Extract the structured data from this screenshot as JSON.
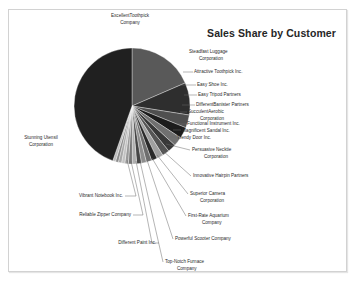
{
  "chart_title": "Sales Share by Customer",
  "chart_data": {
    "type": "pie",
    "title": "Sales Share by Customer",
    "xlabel": "",
    "ylabel": "",
    "legend_position": "none",
    "grid": false,
    "labels_placement": "outside-with-leader-lines",
    "categories": [
      "Excellent Toothpick Company",
      "Steadfast Luggage Corporation",
      "Attractive Toothpick Inc.",
      "Easy Shoe Inc.",
      "Easy Tripod Partners",
      "Different Banister Partners",
      "Succulent Aerobic Corporation",
      "Functional Instrument Inc.",
      "Magnificent Sandal Inc.",
      "Trendy Door Inc.",
      "Persuasive Necktie Corporation",
      "Innovative Hairpin Partners",
      "Superior Camera Corporation",
      "First-Rate Aquarium Company",
      "Powerful Scooter Company",
      "Top-Notch Furnace Company",
      "Different Paint Inc.",
      "Reliable Zipper Company",
      "Vibrant Notebook Inc.",
      "Stunning Utensil Corporation"
    ],
    "values": [
      18.5,
      9.0,
      3.6,
      3.1,
      2.6,
      2.3,
      2.0,
      1.8,
      1.6,
      1.5,
      1.4,
      1.3,
      1.2,
      1.1,
      1.0,
      0.9,
      0.9,
      0.8,
      0.8,
      44.6
    ],
    "units": "percent of sales share",
    "colors": [
      "#595959",
      "#2e2e2e",
      "#4f4f4f",
      "#1c1c1c",
      "#707070",
      "#383838",
      "#555555",
      "#a0a0a0",
      "#2a2a2a",
      "#6e6e6e",
      "#8d8d8d",
      "#454545",
      "#b0b0b0",
      "#767676",
      "#9a9a9a",
      "#c2c2c2",
      "#a8a8a8",
      "#8a8a8a",
      "#bdbdbd",
      "#202020"
    ]
  },
  "labels": [
    {
      "key": "excellent-toothpick-company",
      "lines": [
        "ExcellentToothpick",
        "Company"
      ]
    },
    {
      "key": "steadfast-luggage-corporation",
      "lines": [
        "Steadfast Luggage",
        "Corporation"
      ]
    },
    {
      "key": "attractive-toothpick-inc",
      "lines": [
        "Attractive Toothpick Inc."
      ]
    },
    {
      "key": "easy-shoe-inc",
      "lines": [
        "Easy Shoe Inc."
      ]
    },
    {
      "key": "easy-tripod-partners",
      "lines": [
        "Easy Tripod Partners"
      ]
    },
    {
      "key": "different-banister-partners",
      "lines": [
        "DifferentBanister Partners"
      ]
    },
    {
      "key": "succulent-aerobic-corporation",
      "lines": [
        "SucculentAerobic",
        "Corporation"
      ]
    },
    {
      "key": "functional-instrument-inc",
      "lines": [
        "Functional Instrument Inc."
      ]
    },
    {
      "key": "magnificent-sandal-inc",
      "lines": [
        "Magnificent Sandal Inc."
      ]
    },
    {
      "key": "trendy-door-inc",
      "lines": [
        "Trendy Door Inc."
      ]
    },
    {
      "key": "persuasive-necktie-corporation",
      "lines": [
        "Persuasive Necktie",
        "Corporation"
      ]
    },
    {
      "key": "innovative-hairpin-partners",
      "lines": [
        "Innovative Hairpin Partners"
      ]
    },
    {
      "key": "superior-camera-corporation",
      "lines": [
        "Superior Camera",
        "Corporation"
      ]
    },
    {
      "key": "first-rate-aquarium-company",
      "lines": [
        "First-Rate Aquarium",
        "Company"
      ]
    },
    {
      "key": "powerful-scooter-company",
      "lines": [
        "Powerful Scooter Company"
      ]
    },
    {
      "key": "top-notch-furnace-company",
      "lines": [
        "Top-Notch Furnace",
        "Company"
      ]
    },
    {
      "key": "different-paint-inc",
      "lines": [
        "Different Paint Inc."
      ]
    },
    {
      "key": "reliable-zipper-company",
      "lines": [
        "Reliable Zipper Company"
      ]
    },
    {
      "key": "vibrant-notebook-inc",
      "lines": [
        "Vibrant Notebook Inc."
      ]
    },
    {
      "key": "stunning-utensil-corporation",
      "lines": [
        "Stunning Utensil",
        "Corporation"
      ]
    }
  ],
  "label_text": {
    "excellent_toothpick_l1": "ExcellentToothpick",
    "excellent_toothpick_l2": "Company",
    "steadfast_luggage_l1": "Steadfast Luggage",
    "steadfast_luggage_l2": "Corporation",
    "attractive_toothpick": "Attractive Toothpick Inc.",
    "easy_shoe": "Easy Shoe Inc.",
    "easy_tripod": "Easy Tripod Partners",
    "different_banister": "DifferentBanister Partners",
    "succulent_aerobic_l1": "SucculentAerobic",
    "succulent_aerobic_l2": "Corporation",
    "functional_instrument": "Functional Instrument Inc.",
    "magnificent_sandal": "Magnificent Sandal Inc.",
    "trendy_door": "Trendy Door Inc.",
    "persuasive_necktie_l1": "Persuasive Necktie",
    "persuasive_necktie_l2": "Corporation",
    "innovative_hairpin": "Innovative Hairpin Partners",
    "superior_camera_l1": "Superior Camera",
    "superior_camera_l2": "Corporation",
    "first_rate_aquarium_l1": "First-Rate Aquarium",
    "first_rate_aquarium_l2": "Company",
    "powerful_scooter": "Powerful Scooter Company",
    "top_notch_furnace_l1": "Top-Notch Furnace",
    "top_notch_furnace_l2": "Company",
    "different_paint": "Different Paint Inc.",
    "reliable_zipper": "Reliable Zipper Company",
    "vibrant_notebook": "Vibrant Notebook Inc.",
    "stunning_utensil_l1": "Stunning Utensil",
    "stunning_utensil_l2": "Corporation"
  }
}
